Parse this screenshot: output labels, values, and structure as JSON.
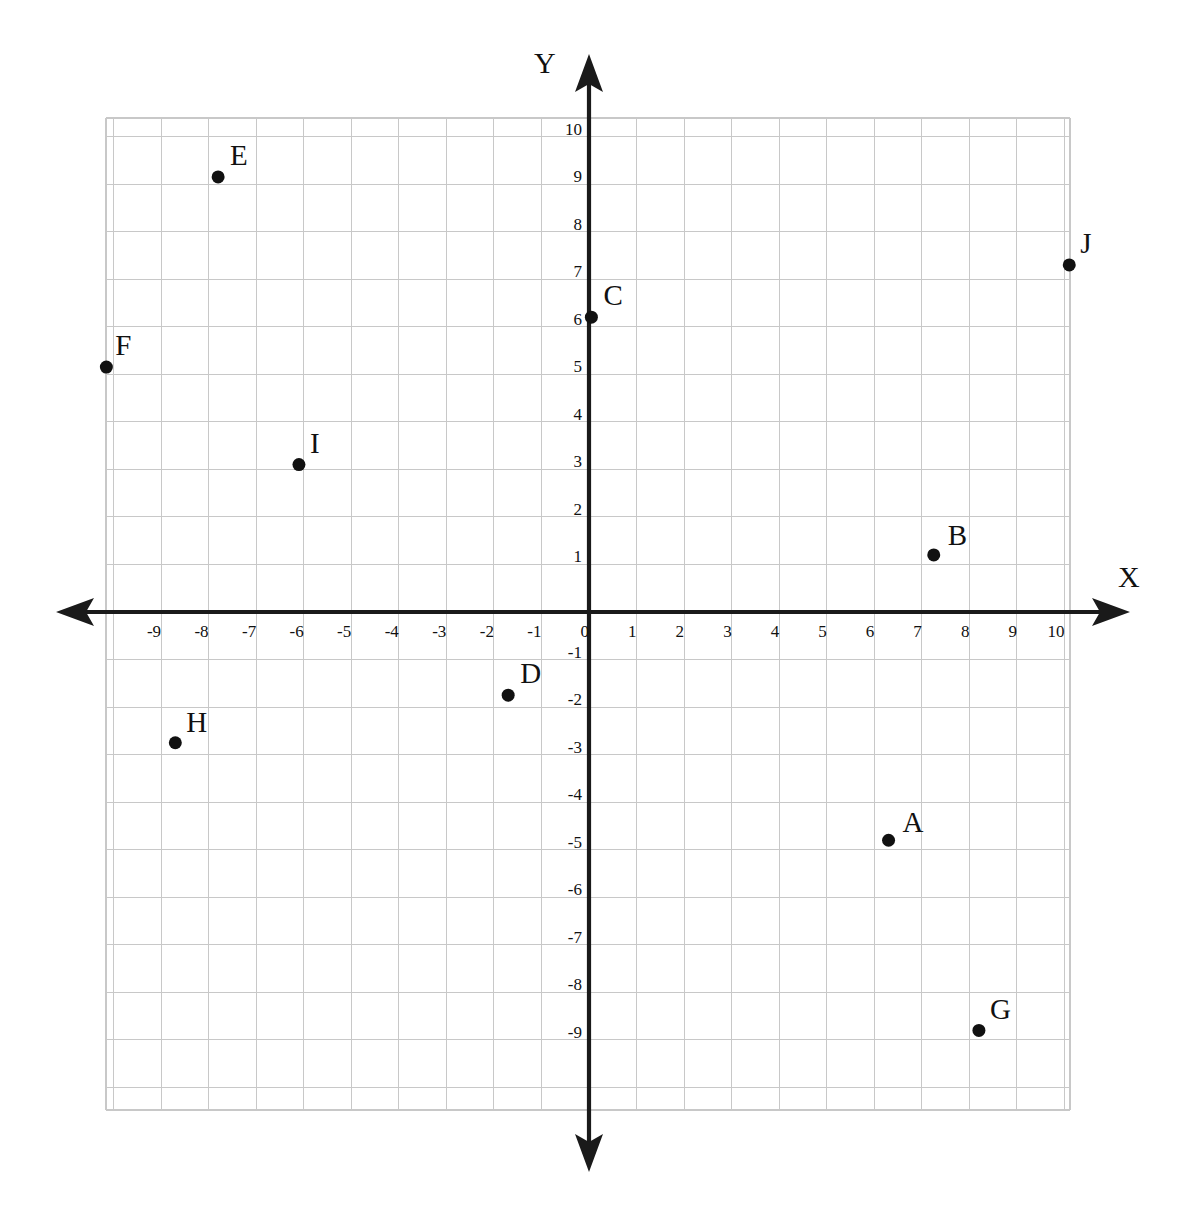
{
  "figure": {
    "title": "",
    "axis_labels": {
      "x": "X",
      "y": "Y"
    },
    "background_color": "#ffffff",
    "grid_color": "#c8c8c8",
    "axis_color": "#1a1a1a",
    "point_color": "#111111"
  },
  "chart_data": {
    "type": "scatter",
    "title": "",
    "xlabel": "X",
    "ylabel": "Y",
    "xlim": [
      -10.4,
      10.4
    ],
    "ylim": [
      -10.5,
      10.4
    ],
    "grid": true,
    "legend": "none",
    "x_tick_labels": [
      "-9",
      "-8",
      "-7",
      "-6",
      "-5",
      "-4",
      "-3",
      "-2",
      "-1",
      "0",
      "1",
      "2",
      "3",
      "4",
      "5",
      "6",
      "7",
      "8",
      "9",
      "10"
    ],
    "x_tick_values": [
      -9,
      -8,
      -7,
      -6,
      -5,
      -4,
      -3,
      -2,
      -1,
      0,
      1,
      2,
      3,
      4,
      5,
      6,
      7,
      8,
      9,
      10
    ],
    "y_tick_labels": [
      "10",
      "9",
      "8",
      "7",
      "6",
      "5",
      "4",
      "3",
      "2",
      "1",
      "-1",
      "-2",
      "-3",
      "-4",
      "-5",
      "-6",
      "-7",
      "-8",
      "-9"
    ],
    "y_tick_values": [
      10,
      9,
      8,
      7,
      6,
      5,
      4,
      3,
      2,
      1,
      -1,
      -2,
      -3,
      -4,
      -5,
      -6,
      -7,
      -8,
      -9
    ],
    "points": [
      {
        "label": "A",
        "x": 6.3,
        "y": -4.8,
        "label_dx": 14,
        "label_dy": -32
      },
      {
        "label": "B",
        "x": 7.25,
        "y": 1.2,
        "label_dx": 14,
        "label_dy": -34
      },
      {
        "label": "C",
        "x": 0.05,
        "y": 6.2,
        "label_dx": 12,
        "label_dy": -36
      },
      {
        "label": "D",
        "x": -1.7,
        "y": -1.75,
        "label_dx": 12,
        "label_dy": -36
      },
      {
        "label": "E",
        "x": -7.8,
        "y": 9.15,
        "label_dx": 12,
        "label_dy": -36
      },
      {
        "label": "F",
        "x": -10.15,
        "y": 5.15,
        "label_dx": 9,
        "label_dy": -36
      },
      {
        "label": "G",
        "x": 8.2,
        "y": -8.8,
        "label_dx": 11,
        "label_dy": -35
      },
      {
        "label": "H",
        "x": -8.7,
        "y": -2.75,
        "label_dx": 11,
        "label_dy": -35
      },
      {
        "label": "I",
        "x": -6.1,
        "y": 3.1,
        "label_dx": 11,
        "label_dy": -36
      },
      {
        "label": "J",
        "x": 10.1,
        "y": 7.3,
        "label_dx": 11,
        "label_dy": -36
      }
    ]
  }
}
